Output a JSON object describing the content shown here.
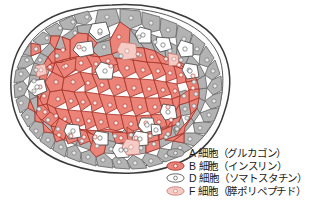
{
  "figure": {
    "name": "pancreatic-islet-of-langerhans-diagram",
    "background_color": "#ffffff"
  },
  "islet": {
    "outline_color": "#3a3a3a",
    "outline_fill": "#fbfbfb",
    "cells": {
      "a_cell": {
        "fill": "#b3b3b3",
        "stroke": "#6e6e6e",
        "nucleus_fill": "#e8e8e8",
        "nucleus_stroke": "#6e6e6e"
      },
      "b_cell": {
        "fill": "#ec8378",
        "stroke": "#a8352b",
        "nucleus_fill": "#fbe9e7",
        "nucleus_stroke": "#a8352b"
      },
      "d_cell": {
        "fill": "#ffffff",
        "stroke": "#555555",
        "nucleus_fill": "#ffffff",
        "nucleus_stroke": "#555555"
      },
      "f_cell": {
        "fill": "#f6cbc6",
        "stroke": "#c97d73",
        "nucleus_fill": "#fdf0ee",
        "nucleus_stroke": "#c97d73"
      }
    }
  },
  "legend": {
    "items": [
      {
        "id": "a-cell",
        "swatch_icon": "oval-cell-gray-icon",
        "swatch_fill": "#b3b3b3",
        "swatch_stroke": "#6e6e6e",
        "label": "A 細胞（グルカゴン）"
      },
      {
        "id": "b-cell",
        "swatch_icon": "oval-cell-salmon-icon",
        "swatch_fill": "#ec8378",
        "swatch_stroke": "#a8352b",
        "label": "B 細胞（インスリン）"
      },
      {
        "id": "d-cell",
        "swatch_icon": "oval-cell-white-icon",
        "swatch_fill": "#ffffff",
        "swatch_stroke": "#555555",
        "label": "D 細胞（ソマトスタチン）"
      },
      {
        "id": "f-cell",
        "swatch_icon": "oval-cell-pink-icon",
        "swatch_fill": "#f6cbc6",
        "swatch_stroke": "#c97d73",
        "label": "F 細胞（膵ポリペプチド）"
      }
    ]
  }
}
